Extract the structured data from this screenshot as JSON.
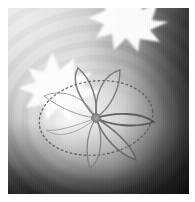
{
  "figure": {
    "kind": "grayscale-scientific-visualization",
    "colors": {
      "canvas": "#ffffff",
      "background_light": "#eeeeee",
      "background_mid": "#a8a8a8",
      "background_dark": "#2a2a2a",
      "glow": "#ffffff",
      "hub": "#8c8c8c",
      "hub_outline": "#6e6e6e",
      "curve_stroke": "#7a7a7a",
      "dotted_stroke": "#5a5a5a"
    },
    "canvas": {
      "width": 195,
      "height": 202,
      "margin": 8
    },
    "plot_area": {
      "x": 8,
      "y": 8,
      "width": 181,
      "height": 186
    },
    "center_hub": {
      "x": 95,
      "y": 117,
      "radius": 4.2
    },
    "ellipse": {
      "cx": 95,
      "cy": 117,
      "rx": 57,
      "ry": 37,
      "rotation_deg": -7,
      "style": "dotted"
    },
    "petal_count": 6,
    "bursts": [
      {
        "name": "burst-top",
        "cx": 118,
        "cy": 6,
        "radius": 30,
        "points": 9
      },
      {
        "name": "burst-left",
        "cx": 50,
        "cy": 76,
        "radius": 28,
        "points": 11
      }
    ],
    "ring_bands": [
      {
        "r": 34,
        "opacity": 0.1
      },
      {
        "r": 48,
        "opacity": 0.09
      },
      {
        "r": 62,
        "opacity": 0.08
      },
      {
        "r": 77,
        "opacity": 0.07
      },
      {
        "r": 93,
        "opacity": 0.06
      },
      {
        "r": 110,
        "opacity": 0.05
      },
      {
        "r": 128,
        "opacity": 0.045
      },
      {
        "r": 147,
        "opacity": 0.04
      }
    ],
    "ring_origin": {
      "x": 96,
      "y": 120
    }
  }
}
